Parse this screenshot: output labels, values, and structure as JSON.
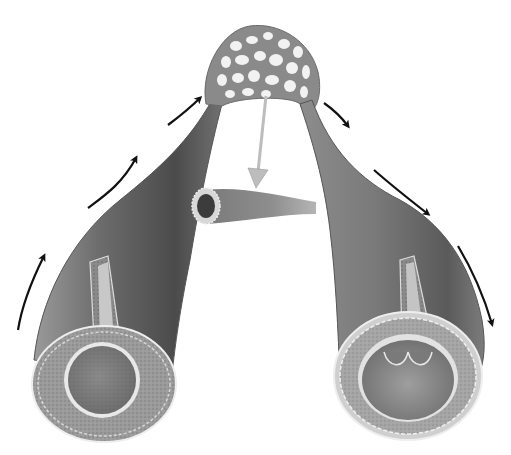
{
  "figure": {
    "alt_text": "Illustration of an artery branching into a capillary network and draining into a vein, with flow direction arrows",
    "colors": {
      "background": "#ffffff",
      "vessel_dark": "#4a4a4a",
      "vessel_mid": "#7a7a7a",
      "vessel_light": "#b5b5b5",
      "tissue": "#9c9c9c",
      "lining": "#e6e6e6",
      "arrow": "#111111",
      "pointer_arrow": "#bdbdbd"
    },
    "parts": [
      {
        "name": "artery",
        "side": "left"
      },
      {
        "name": "capillary-bed",
        "side": "top-center"
      },
      {
        "name": "capillary-cross-section",
        "side": "center"
      },
      {
        "name": "vein",
        "side": "right"
      },
      {
        "name": "vein-valves",
        "side": "right-lumen"
      }
    ],
    "flow_arrows": {
      "left": 3,
      "right": 4,
      "direction": "artery up into capillaries, capillaries down into vein"
    }
  }
}
